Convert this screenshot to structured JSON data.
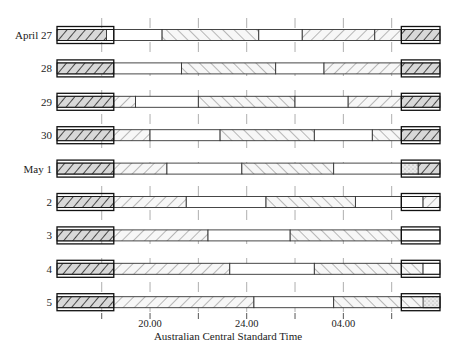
{
  "chart_data": {
    "type": "timeline",
    "title": "",
    "xlabel": "Australian Central Standard Time",
    "x_unit": "hours (18 = 18:00, 24 = 24:00, 28 = 04:00 next day)",
    "xlim": [
      16.15,
      32.0
    ],
    "x_ticks": [
      {
        "value": 18,
        "label": ""
      },
      {
        "value": 20,
        "label": "20.00"
      },
      {
        "value": 22,
        "label": ""
      },
      {
        "value": 24,
        "label": "24.00"
      },
      {
        "value": 26,
        "label": ""
      },
      {
        "value": 28,
        "label": "04.00"
      },
      {
        "value": 30,
        "label": ""
      }
    ],
    "grid": "vertical dashed at every 2 hours",
    "legend": "none",
    "fill_types": {
      "dark": "dense dark hatch (boxed)",
      "fwd": "forward diagonal hatch",
      "back": "backward diagonal hatch",
      "clear": "empty",
      "stipple": "grey stipple"
    },
    "box_extent": {
      "left": [
        16.15,
        18.5
      ],
      "right": [
        30.4,
        32.0
      ]
    },
    "rows": [
      {
        "label": "April 27",
        "segments": [
          {
            "start": 16.15,
            "end": 18.2,
            "fill": "dark"
          },
          {
            "start": 18.2,
            "end": 18.5,
            "fill": "clear"
          },
          {
            "start": 18.5,
            "end": 20.5,
            "fill": "clear"
          },
          {
            "start": 20.5,
            "end": 24.5,
            "fill": "back"
          },
          {
            "start": 24.5,
            "end": 26.3,
            "fill": "clear"
          },
          {
            "start": 26.3,
            "end": 29.3,
            "fill": "fwd"
          },
          {
            "start": 29.3,
            "end": 30.4,
            "fill": "fwd"
          },
          {
            "start": 30.4,
            "end": 32.0,
            "fill": "dark"
          }
        ]
      },
      {
        "label": "28",
        "segments": [
          {
            "start": 16.15,
            "end": 18.5,
            "fill": "dark"
          },
          {
            "start": 18.5,
            "end": 21.3,
            "fill": "clear"
          },
          {
            "start": 21.3,
            "end": 25.2,
            "fill": "back"
          },
          {
            "start": 25.2,
            "end": 27.2,
            "fill": "clear"
          },
          {
            "start": 27.2,
            "end": 30.4,
            "fill": "fwd"
          },
          {
            "start": 30.4,
            "end": 32.0,
            "fill": "dark"
          }
        ]
      },
      {
        "label": "29",
        "segments": [
          {
            "start": 16.15,
            "end": 18.5,
            "fill": "dark"
          },
          {
            "start": 18.5,
            "end": 19.4,
            "fill": "fwd"
          },
          {
            "start": 19.4,
            "end": 22.0,
            "fill": "clear"
          },
          {
            "start": 22.0,
            "end": 26.0,
            "fill": "back"
          },
          {
            "start": 26.0,
            "end": 28.2,
            "fill": "clear"
          },
          {
            "start": 28.2,
            "end": 30.4,
            "fill": "fwd"
          },
          {
            "start": 30.4,
            "end": 32.0,
            "fill": "dark"
          }
        ]
      },
      {
        "label": "30",
        "segments": [
          {
            "start": 16.15,
            "end": 18.5,
            "fill": "dark"
          },
          {
            "start": 18.5,
            "end": 20.0,
            "fill": "fwd"
          },
          {
            "start": 20.0,
            "end": 22.9,
            "fill": "clear"
          },
          {
            "start": 22.9,
            "end": 26.8,
            "fill": "back"
          },
          {
            "start": 26.8,
            "end": 29.2,
            "fill": "clear"
          },
          {
            "start": 29.2,
            "end": 30.4,
            "fill": "back"
          },
          {
            "start": 30.4,
            "end": 32.0,
            "fill": "dark"
          }
        ]
      },
      {
        "label": "May 1",
        "segments": [
          {
            "start": 16.15,
            "end": 18.5,
            "fill": "dark"
          },
          {
            "start": 18.5,
            "end": 20.7,
            "fill": "fwd"
          },
          {
            "start": 20.7,
            "end": 23.8,
            "fill": "clear"
          },
          {
            "start": 23.8,
            "end": 27.6,
            "fill": "back"
          },
          {
            "start": 27.6,
            "end": 30.4,
            "fill": "clear"
          },
          {
            "start": 30.4,
            "end": 31.1,
            "fill": "stipple"
          },
          {
            "start": 31.1,
            "end": 32.0,
            "fill": "dark"
          }
        ]
      },
      {
        "label": "2",
        "segments": [
          {
            "start": 16.15,
            "end": 18.5,
            "fill": "dark"
          },
          {
            "start": 18.5,
            "end": 21.5,
            "fill": "fwd"
          },
          {
            "start": 21.5,
            "end": 24.8,
            "fill": "clear"
          },
          {
            "start": 24.8,
            "end": 28.5,
            "fill": "back"
          },
          {
            "start": 28.5,
            "end": 30.4,
            "fill": "clear"
          },
          {
            "start": 30.4,
            "end": 31.3,
            "fill": "clear"
          },
          {
            "start": 31.3,
            "end": 32.0,
            "fill": "fwd"
          }
        ]
      },
      {
        "label": "3",
        "segments": [
          {
            "start": 16.15,
            "end": 18.5,
            "fill": "dark"
          },
          {
            "start": 18.5,
            "end": 22.4,
            "fill": "fwd"
          },
          {
            "start": 22.4,
            "end": 25.8,
            "fill": "clear"
          },
          {
            "start": 25.8,
            "end": 30.4,
            "fill": "back"
          },
          {
            "start": 30.4,
            "end": 32.0,
            "fill": "clear"
          }
        ]
      },
      {
        "label": "4",
        "segments": [
          {
            "start": 16.15,
            "end": 18.5,
            "fill": "dark"
          },
          {
            "start": 18.5,
            "end": 23.3,
            "fill": "fwd"
          },
          {
            "start": 23.3,
            "end": 26.8,
            "fill": "clear"
          },
          {
            "start": 26.8,
            "end": 30.4,
            "fill": "back"
          },
          {
            "start": 30.4,
            "end": 31.3,
            "fill": "back"
          },
          {
            "start": 31.3,
            "end": 32.0,
            "fill": "clear"
          }
        ]
      },
      {
        "label": "5",
        "segments": [
          {
            "start": 16.15,
            "end": 18.5,
            "fill": "dark"
          },
          {
            "start": 18.5,
            "end": 24.3,
            "fill": "fwd"
          },
          {
            "start": 24.3,
            "end": 27.6,
            "fill": "clear"
          },
          {
            "start": 27.6,
            "end": 30.4,
            "fill": "back"
          },
          {
            "start": 30.4,
            "end": 32.0,
            "fill": "back"
          },
          {
            "start": 31.3,
            "end": 32.0,
            "fill": "stipple"
          }
        ]
      }
    ]
  }
}
